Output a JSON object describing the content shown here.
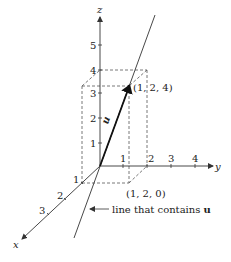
{
  "diagram": {
    "axes": {
      "x": {
        "label": "x",
        "ticks": [
          "1",
          "2",
          "3"
        ]
      },
      "y": {
        "label": "y",
        "ticks": [
          "1",
          "2",
          "3",
          "4"
        ]
      },
      "z": {
        "label": "z",
        "ticks": [
          "1",
          "2",
          "3",
          "4",
          "5"
        ]
      }
    },
    "points": {
      "top": "(1, 2, 4)",
      "base": "(1, 2, 0)"
    },
    "vector_label": "u",
    "annotation": {
      "text": "line that contains ",
      "bold_text": "u"
    },
    "colors": {
      "line": "#333333",
      "dashed": "#555555",
      "text": "#222222"
    }
  }
}
